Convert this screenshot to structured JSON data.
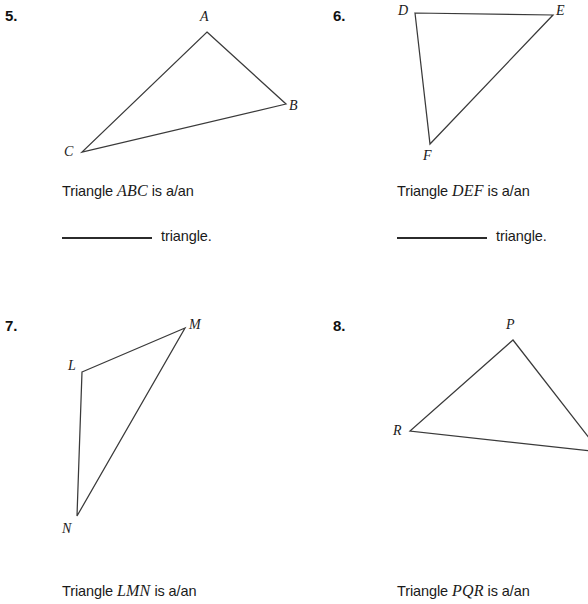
{
  "page": {
    "width": 588,
    "height": 604,
    "background": "#ffffff",
    "ink": "#1a1a1a",
    "line_color": "#3a3a3a"
  },
  "problems": [
    {
      "number": "5.",
      "triangle_name": "ABC",
      "prompt_prefix": "Triangle ",
      "prompt_suffix": " is a/an",
      "answer_word": "triangle.",
      "vertices": [
        {
          "label": "A",
          "x": 207,
          "y": 32
        },
        {
          "label": "B",
          "x": 286,
          "y": 104
        },
        {
          "label": "C",
          "x": 82,
          "y": 152
        }
      ],
      "labels": [
        {
          "label": "A",
          "x": 200,
          "y": 10
        },
        {
          "label": "B",
          "x": 289,
          "y": 99
        },
        {
          "label": "C",
          "x": 64,
          "y": 145
        }
      ]
    },
    {
      "number": "6.",
      "triangle_name": "DEF",
      "prompt_prefix": "Triangle ",
      "prompt_suffix": " is a/an",
      "answer_word": "triangle.",
      "vertices": [
        {
          "label": "D",
          "x": 415,
          "y": 13
        },
        {
          "label": "E",
          "x": 553,
          "y": 15
        },
        {
          "label": "F",
          "x": 430,
          "y": 144
        }
      ],
      "labels": [
        {
          "label": "D",
          "x": 398,
          "y": 4
        },
        {
          "label": "E",
          "x": 556,
          "y": 4
        },
        {
          "label": "F",
          "x": 423,
          "y": 149
        }
      ]
    },
    {
      "number": "7.",
      "triangle_name": "LMN",
      "prompt_prefix": "Triangle ",
      "prompt_suffix": " is a/an",
      "answer_word": "triangle.",
      "vertices": [
        {
          "label": "L",
          "x": 82,
          "y": 372
        },
        {
          "label": "M",
          "x": 185,
          "y": 328
        },
        {
          "label": "N",
          "x": 77,
          "y": 516
        }
      ],
      "labels": [
        {
          "label": "L",
          "x": 68,
          "y": 359
        },
        {
          "label": "M",
          "x": 189,
          "y": 318
        },
        {
          "label": "N",
          "x": 62,
          "y": 522
        }
      ]
    },
    {
      "number": "8.",
      "triangle_name": "PQR",
      "prompt_prefix": "Triangle ",
      "prompt_suffix": " is a/an",
      "answer_word": "triangle.",
      "clipped": true,
      "vertices": [
        {
          "label": "P",
          "x": 513,
          "y": 340
        },
        {
          "label": "Q",
          "x": 600,
          "y": 452
        },
        {
          "label": "R",
          "x": 410,
          "y": 431
        }
      ],
      "labels": [
        {
          "label": "P",
          "x": 506,
          "y": 318
        },
        {
          "label": "R",
          "x": 393,
          "y": 424
        }
      ]
    }
  ],
  "layout": {
    "num_positions": [
      {
        "x": 5,
        "y": 8
      },
      {
        "x": 333,
        "y": 8
      },
      {
        "x": 5,
        "y": 318
      },
      {
        "x": 333,
        "y": 318
      }
    ],
    "prompt_positions": [
      {
        "x": 62,
        "y": 182
      },
      {
        "x": 397,
        "y": 182
      },
      {
        "x": 62,
        "y": 582
      },
      {
        "x": 397,
        "y": 582
      }
    ],
    "answer_positions": [
      {
        "x": 62,
        "y": 228
      },
      {
        "x": 397,
        "y": 228
      }
    ]
  }
}
